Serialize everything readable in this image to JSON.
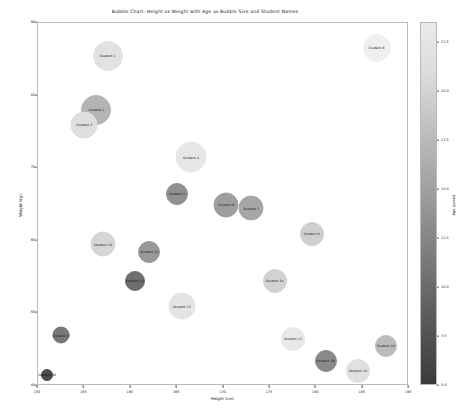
{
  "chart_data": {
    "type": "scatter",
    "title": "Bubble Chart: Height vs Weight with Age as Bubble Size and Student Names",
    "xlabel": "Height (cm)",
    "ylabel": "Weight (kg)",
    "xlim": [
      150,
      190
    ],
    "ylim": [
      40,
      90
    ],
    "xticks": [
      "150",
      "155",
      "160",
      "165",
      "170",
      "175",
      "180",
      "185",
      "190"
    ],
    "yticks": [
      "40",
      "50",
      "60",
      "70",
      "80",
      "90"
    ],
    "grid": false,
    "legend_position": "none",
    "size_encodes": "Age (years)",
    "color_encodes": "Age (years)",
    "colorbar": {
      "label": "Age (years)",
      "ticks": [
        "22.5",
        "20.0",
        "17.5",
        "15.0",
        "12.5",
        "10.0",
        "7.5",
        "5.0"
      ],
      "range": [
        5.0,
        23.5
      ],
      "colormap": "grey (dark=low, light=high)"
    },
    "points": [
      {
        "label": "Student 1",
        "x": 157.5,
        "y": 85.5,
        "age": 21.0,
        "size": 30,
        "color": "#e2e2e2"
      },
      {
        "label": "Student 2",
        "x": 156.3,
        "y": 78.0,
        "age": 16.0,
        "size": 30,
        "color": "#b4b4b4"
      },
      {
        "label": "Student 3",
        "x": 155.0,
        "y": 76.0,
        "age": 20.5,
        "size": 27,
        "color": "#dedede"
      },
      {
        "label": "Student 4",
        "x": 166.5,
        "y": 71.5,
        "age": 22.0,
        "size": 31,
        "color": "#e7e7e7"
      },
      {
        "label": "Student 5",
        "x": 165.0,
        "y": 66.5,
        "age": 11.0,
        "size": 22,
        "color": "#8f8f8f"
      },
      {
        "label": "Student 6",
        "x": 170.3,
        "y": 65.0,
        "age": 13.0,
        "size": 25,
        "color": "#9e9e9e"
      },
      {
        "label": "Student 7",
        "x": 173.0,
        "y": 64.5,
        "age": 14.0,
        "size": 25,
        "color": "#a6a6a6"
      },
      {
        "label": "Student 8",
        "x": 186.5,
        "y": 86.5,
        "age": 23.0,
        "size": 28,
        "color": "#efefef"
      },
      {
        "label": "Student 9",
        "x": 179.5,
        "y": 61.0,
        "age": 19.0,
        "size": 24,
        "color": "#cfcfcf"
      },
      {
        "label": "Student 10",
        "x": 157.0,
        "y": 59.5,
        "age": 20.0,
        "size": 25,
        "color": "#d6d6d6"
      },
      {
        "label": "Student 11",
        "x": 162.0,
        "y": 58.5,
        "age": 12.5,
        "size": 22,
        "color": "#999999"
      },
      {
        "label": "Student 12",
        "x": 160.5,
        "y": 54.5,
        "age": 8.0,
        "size": 20,
        "color": "#6e6e6e"
      },
      {
        "label": "Student 13",
        "x": 165.5,
        "y": 51.0,
        "age": 21.5,
        "size": 27,
        "color": "#e4e4e4"
      },
      {
        "label": "Student 14",
        "x": 175.5,
        "y": 54.5,
        "age": 19.5,
        "size": 24,
        "color": "#d2d2d2"
      },
      {
        "label": "Student 15",
        "x": 152.5,
        "y": 47.0,
        "age": 9.0,
        "size": 17,
        "color": "#787878"
      },
      {
        "label": "Student 16",
        "x": 151.0,
        "y": 41.5,
        "age": 6.0,
        "size": 12,
        "color": "#4d4d4d"
      },
      {
        "label": "Student 17",
        "x": 177.5,
        "y": 46.5,
        "age": 22.5,
        "size": 24,
        "color": "#e8e8e8"
      },
      {
        "label": "Student 18",
        "x": 181.0,
        "y": 43.5,
        "age": 10.5,
        "size": 22,
        "color": "#8a8a8a"
      },
      {
        "label": "Student 19",
        "x": 184.5,
        "y": 42.0,
        "age": 21.0,
        "size": 24,
        "color": "#e0e0e0"
      },
      {
        "label": "Student 20",
        "x": 187.5,
        "y": 45.5,
        "age": 17.0,
        "size": 22,
        "color": "#bcbcbc"
      }
    ]
  }
}
